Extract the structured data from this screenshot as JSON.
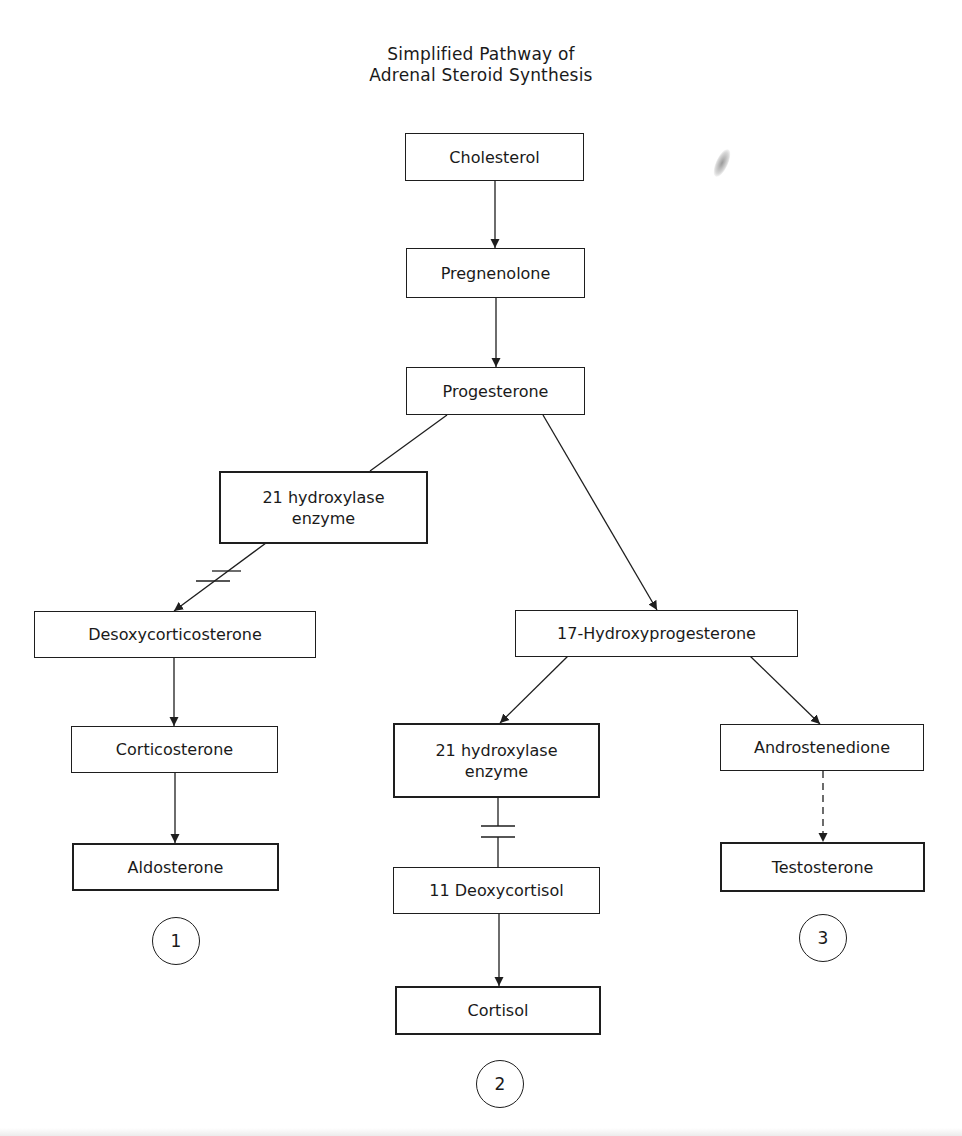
{
  "title": {
    "line1": "Simplified Pathway of",
    "line2": "Adrenal Steroid Synthesis"
  },
  "nodes": {
    "cholesterol": "Cholesterol",
    "pregnenolone": "Pregnenolone",
    "progesterone": "Progesterone",
    "enzyme_left": "21 hydroxylase\nenzyme",
    "desoxycorticosterone": "Desoxycorticosterone",
    "corticosterone": "Corticosterone",
    "aldosterone": "Aldosterone",
    "hydroxyprogesterone": "17-Hydroxyprogesterone",
    "enzyme_middle": "21 hydroxylase\nenzyme",
    "deoxycortisol": "11 Deoxycortisol",
    "cortisol": "Cortisol",
    "androstenedione": "Androstenedione",
    "testosterone": "Testosterone"
  },
  "pathway_markers": {
    "left": "1",
    "middle": "2",
    "right": "3"
  },
  "edges": [
    {
      "from": "Cholesterol",
      "to": "Pregnenolone",
      "style": "solid"
    },
    {
      "from": "Pregnenolone",
      "to": "Progesterone",
      "style": "solid"
    },
    {
      "from": "Progesterone",
      "to": "21 hydroxylase enzyme (left)",
      "style": "solid-line"
    },
    {
      "from": "21 hydroxylase enzyme (left)",
      "to": "Desoxycorticosterone",
      "style": "blocked"
    },
    {
      "from": "Progesterone",
      "to": "17-Hydroxyprogesterone",
      "style": "solid"
    },
    {
      "from": "Desoxycorticosterone",
      "to": "Corticosterone",
      "style": "solid"
    },
    {
      "from": "Corticosterone",
      "to": "Aldosterone",
      "style": "solid"
    },
    {
      "from": "17-Hydroxyprogesterone",
      "to": "21 hydroxylase enzyme (middle)",
      "style": "solid"
    },
    {
      "from": "21 hydroxylase enzyme (middle)",
      "to": "11 Deoxycortisol",
      "style": "blocked"
    },
    {
      "from": "11 Deoxycortisol",
      "to": "Cortisol",
      "style": "solid"
    },
    {
      "from": "17-Hydroxyprogesterone",
      "to": "Androstenedione",
      "style": "solid"
    },
    {
      "from": "Androstenedione",
      "to": "Testosterone",
      "style": "dashed"
    }
  ],
  "colors": {
    "ink": "#1e1e1e",
    "background": "#ffffff"
  }
}
